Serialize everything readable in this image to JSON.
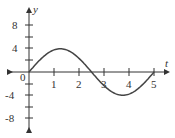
{
  "chart_data": {
    "type": "line",
    "title": "",
    "xlabel": "t",
    "ylabel": "y",
    "xlim": [
      -0.2,
      5.4
    ],
    "ylim": [
      -10,
      10
    ],
    "grid": false,
    "x_ticks": [
      "1",
      "2",
      "3",
      "4",
      "5"
    ],
    "y_ticks": [
      "8",
      "4",
      "-4",
      "-8"
    ],
    "origin_label": "0",
    "series": [
      {
        "name": "y(t)",
        "function": "8 sin(2πt/5)",
        "x": [
          0,
          0.625,
          1.25,
          1.875,
          2.5,
          3.125,
          3.75,
          4.375,
          5
        ],
        "values": [
          0,
          5.66,
          8,
          5.66,
          0,
          -5.66,
          -8,
          -5.66,
          0
        ]
      }
    ],
    "color": "#333333"
  }
}
